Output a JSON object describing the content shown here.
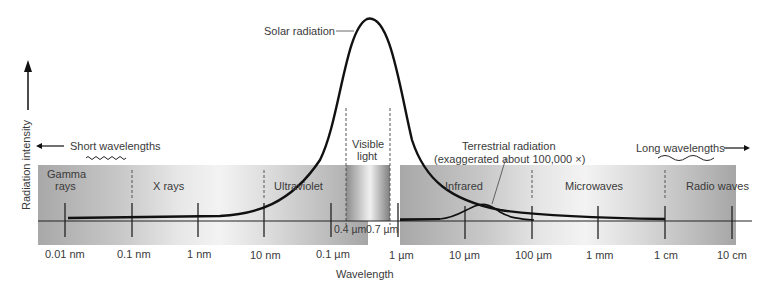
{
  "axes": {
    "y_label": "Radiation intensity",
    "x_label": "Wavelength"
  },
  "direction_labels": {
    "short": "Short wavelengths",
    "long": "Long wavelengths"
  },
  "bands": [
    {
      "name": "gamma",
      "label_line1": "Gamma",
      "label_line2": "rays"
    },
    {
      "name": "xray",
      "label_line1": "X rays",
      "label_line2": ""
    },
    {
      "name": "ultraviolet",
      "label_line1": "Ultraviolet",
      "label_line2": ""
    },
    {
      "name": "visible",
      "label_line1": "Visible",
      "label_line2": "light"
    },
    {
      "name": "infrared",
      "label_line1": "Infrared",
      "label_line2": ""
    },
    {
      "name": "microwaves",
      "label_line1": "Microwaves",
      "label_line2": ""
    },
    {
      "name": "radio",
      "label_line1": "Radio waves",
      "label_line2": ""
    }
  ],
  "ticks": [
    "0.01 nm",
    "0.1 nm",
    "1 nm",
    "10 nm",
    "0.1 µm",
    "1 µm",
    "10 µm",
    "100 µm",
    "1 mm",
    "1 cm",
    "10 cm"
  ],
  "visible_range": {
    "start": "0.4 µm",
    "end": "0.7 µm"
  },
  "curves": {
    "solar": "Solar radiation",
    "terrestrial_line1": "Terrestrial radiation",
    "terrestrial_line2": "(exaggerated about 100,000 ×)"
  },
  "colors": {
    "band_dark": "#a9a9a9",
    "band_light": "#f2f2f2",
    "curve": "#111111",
    "text": "#3a3a3a"
  }
}
